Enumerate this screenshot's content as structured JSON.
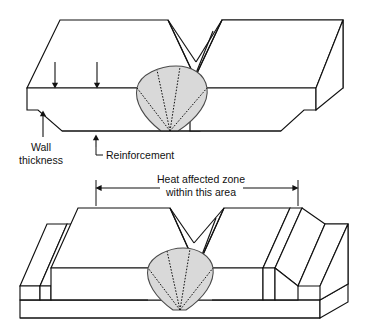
{
  "figure": {
    "title": "Welded joint cross-section with heat affected zone",
    "colors": {
      "line": "#111111",
      "weld_fill": "#d9d9d9",
      "weld_outline": "#4a4a4a",
      "background": "#ffffff"
    },
    "labels": {
      "wall_thickness_line1": "Wall",
      "wall_thickness_line2": "thickness",
      "reinforcement": "Reinforcement",
      "haz_line1": "Heat affected zone",
      "haz_line2": "within this area"
    },
    "panels": [
      {
        "name": "top-panel",
        "description": "Butt weld viewed in isometric, flush reinforcement, weld nugget shaded",
        "callouts": [
          "Wall thickness",
          "Reinforcement"
        ]
      },
      {
        "name": "bottom-panel",
        "description": "Butt weld viewed in isometric with raised reinforcement strips and heat affected zone dimension",
        "callouts": [
          "Heat affected zone within this area"
        ]
      }
    ]
  }
}
